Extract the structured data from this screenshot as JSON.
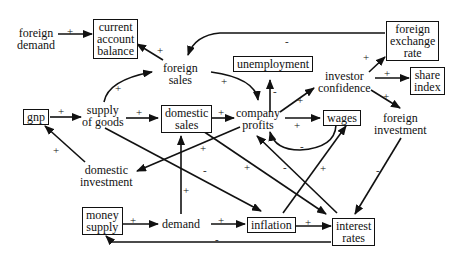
{
  "diagram": {
    "type": "causal-loop",
    "nodes": {
      "foreign_demand": {
        "l1": "foreign",
        "l2": "demand"
      },
      "current_account_balance": {
        "l1": "current",
        "l2": "account",
        "l3": "balance"
      },
      "foreign_sales": {
        "l1": "foreign",
        "l2": "sales"
      },
      "unemployment": {
        "l1": "unemployment"
      },
      "foreign_exchange_rate": {
        "l1": "foreign",
        "l2": "exchange",
        "l3": "rate"
      },
      "investor_confidence": {
        "l1": "investor",
        "l2": "confidence"
      },
      "share_index": {
        "l1": "share",
        "l2": "index"
      },
      "gnp": {
        "l1": "gnp"
      },
      "supply_of_goods": {
        "l1": "supply",
        "l2": "of goods"
      },
      "domestic_sales": {
        "l1": "domestic",
        "l2": "sales"
      },
      "company_profits": {
        "l1": "company",
        "l2": "profits"
      },
      "wages": {
        "l1": "wages"
      },
      "foreign_investment": {
        "l1": "foreign",
        "l2": "investment"
      },
      "domestic_investment": {
        "l1": "domestic",
        "l2": "investment"
      },
      "money_supply": {
        "l1": "money",
        "l2": "supply"
      },
      "demand": {
        "l1": "demand"
      },
      "inflation": {
        "l1": "inflation"
      },
      "interest_rates": {
        "l1": "interest",
        "l2": "rates"
      }
    },
    "signs": {
      "fd_cab": "+",
      "fs_cab": "+",
      "fer_fs": "-",
      "sog_fs": "+",
      "fs_cp": "+",
      "cp_unemp": "-",
      "cp_ic": "+",
      "ic_fer": "+",
      "ic_si": "+",
      "ic_fi": "+",
      "gnp_sog": "+",
      "sog_ds": "+",
      "ds_cp": "+",
      "cp_wages": "+",
      "wages_cp": "-",
      "di_gnp": "+",
      "cp_di": "+",
      "sog_inf": "-",
      "ds_ir": "+",
      "ir_cp": "-",
      "inf_wages": "+",
      "fi_ir": "-",
      "demand_ds": "+",
      "ms_demand": "+",
      "demand_inf": "+",
      "inf_ir": "+",
      "ir_ms": "-"
    }
  }
}
